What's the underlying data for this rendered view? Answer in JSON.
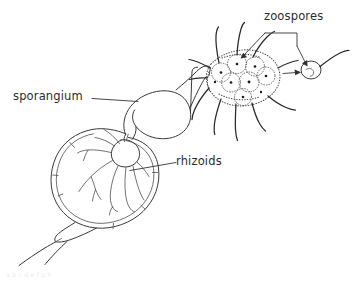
{
  "figure": {
    "background_color": "#ffffff",
    "ink_color": "#3a3a3c",
    "nucleus_color": "#1c1c1e",
    "width": 352,
    "height": 284
  },
  "labels": {
    "zoospores": "zoospores",
    "sporangium": "sporangium",
    "rhizoids": "rhizoids"
  },
  "structures": {
    "sporangium_name": "sporangium",
    "host_cell_name": "host cell",
    "rhizoid_name": "rhizoids",
    "zoospore_mass_name": "zoospore mass",
    "free_zoospore_name": "released zoospore",
    "flagellum_name": "flagellum"
  },
  "counts": {
    "zoospores_in_mass": 7,
    "free_zoospores": 1,
    "flagella": 11,
    "rhizoid_branches": 7
  },
  "footer": {
    "caption_fragment": "a    b         c          d      e                    f           g         h"
  }
}
